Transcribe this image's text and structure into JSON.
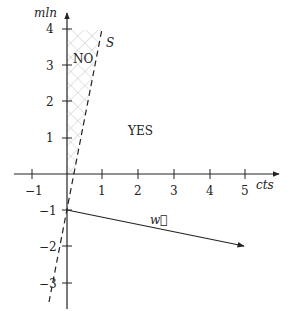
{
  "diagram": {
    "axes": {
      "x_label": "cts",
      "y_label": "mln",
      "x_ticks": [
        "−1",
        "1",
        "2",
        "3",
        "4",
        "5"
      ],
      "y_ticks": [
        "4",
        "3",
        "2",
        "1",
        "−1",
        "−2",
        "−3"
      ]
    },
    "regions": {
      "no_label": "NO",
      "yes_label": "YES"
    },
    "line_label": "S",
    "vector_label": "w⃗",
    "vector": {
      "from": [
        0,
        -1
      ],
      "to": [
        5,
        -2
      ]
    },
    "separator_line": {
      "through": [
        [
          0,
          -1
        ],
        [
          1,
          4
        ]
      ],
      "style": "dashed"
    },
    "hatched_region": "between y-axis and line S, above x-axis"
  }
}
